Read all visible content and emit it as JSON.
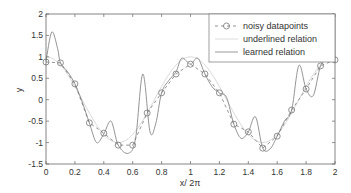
{
  "chart_data": {
    "type": "line",
    "title": "",
    "xlabel": "x/ 2π",
    "ylabel": "y",
    "xlim": [
      0,
      2
    ],
    "ylim": [
      -1.5,
      2
    ],
    "x_ticks": [
      0,
      0.2,
      0.4,
      0.6,
      0.8,
      1,
      1.2,
      1.4,
      1.6,
      1.8,
      2
    ],
    "x_tick_labels": [
      "0",
      "0.2",
      "0.4",
      "0.6",
      "0.8",
      "1",
      "1.2",
      "1.4",
      "1.6",
      "1.8",
      "2"
    ],
    "y_ticks": [
      2,
      1.5,
      1,
      0.5,
      0,
      -0.5,
      -1,
      -1.5
    ],
    "y_tick_labels": [
      "2",
      "1.5",
      "1",
      "0.5",
      "0",
      "-0.5",
      "-1",
      "-1.5"
    ],
    "grid": false,
    "legend_position": "upper right",
    "series": [
      {
        "name": "noisy datapoints",
        "style": "dashed line with circle markers",
        "color": "#777777",
        "x": [
          0,
          0.1,
          0.2,
          0.3,
          0.4,
          0.5,
          0.6,
          0.7,
          0.8,
          0.9,
          1.0,
          1.1,
          1.2,
          1.3,
          1.4,
          1.5,
          1.6,
          1.7,
          1.8,
          1.9,
          2.0
        ],
        "y": [
          0.88,
          0.86,
          0.37,
          -0.54,
          -0.78,
          -1.06,
          -1.06,
          -0.31,
          0.16,
          0.6,
          0.83,
          0.6,
          0.16,
          -0.57,
          -0.75,
          -1.13,
          -0.85,
          -0.24,
          0.25,
          0.79,
          0.93
        ]
      },
      {
        "name": "underlined relation",
        "style": "solid light line",
        "color": "#d8d8d8",
        "x": [
          0,
          0.1,
          0.2,
          0.3,
          0.4,
          0.5,
          0.6,
          0.7,
          0.8,
          0.9,
          1.0,
          1.1,
          1.2,
          1.3,
          1.4,
          1.5,
          1.6,
          1.7,
          1.8,
          1.9,
          2.0
        ],
        "y": [
          1.0,
          0.81,
          0.31,
          -0.31,
          -0.81,
          -1.0,
          -0.81,
          -0.31,
          0.31,
          0.81,
          1.0,
          0.81,
          0.31,
          -0.31,
          -0.81,
          -1.0,
          -0.81,
          -0.31,
          0.31,
          0.81,
          1.0
        ]
      },
      {
        "name": "learned relation",
        "style": "solid line",
        "color": "#888888",
        "x": [
          0,
          0.04,
          0.08,
          0.1,
          0.15,
          0.2,
          0.25,
          0.3,
          0.35,
          0.4,
          0.45,
          0.5,
          0.57,
          0.62,
          0.67,
          0.72,
          0.76,
          0.8,
          0.85,
          0.9,
          0.94,
          1.0,
          1.05,
          1.1,
          1.15,
          1.2,
          1.25,
          1.3,
          1.35,
          1.4,
          1.45,
          1.5,
          1.55,
          1.6,
          1.65,
          1.7,
          1.75,
          1.8,
          1.85,
          1.9,
          1.95,
          2.0
        ],
        "y": [
          0.9,
          1.58,
          1.2,
          0.86,
          0.65,
          0.37,
          -0.05,
          -0.54,
          -1.0,
          -0.8,
          -0.5,
          -1.06,
          -1.25,
          -0.9,
          0.6,
          -0.75,
          -0.55,
          0.16,
          0.45,
          0.65,
          0.97,
          0.83,
          0.97,
          0.6,
          0.3,
          0.16,
          0.05,
          -0.57,
          -0.9,
          -0.75,
          -0.4,
          -1.13,
          -1.15,
          -0.85,
          -0.5,
          -0.24,
          0.8,
          0.25,
          0.1,
          0.79,
          0.95,
          0.93
        ]
      }
    ]
  },
  "legend": {
    "items": [
      {
        "label": "noisy datapoints"
      },
      {
        "label": "underlined relation"
      },
      {
        "label": "learned relation"
      }
    ]
  }
}
